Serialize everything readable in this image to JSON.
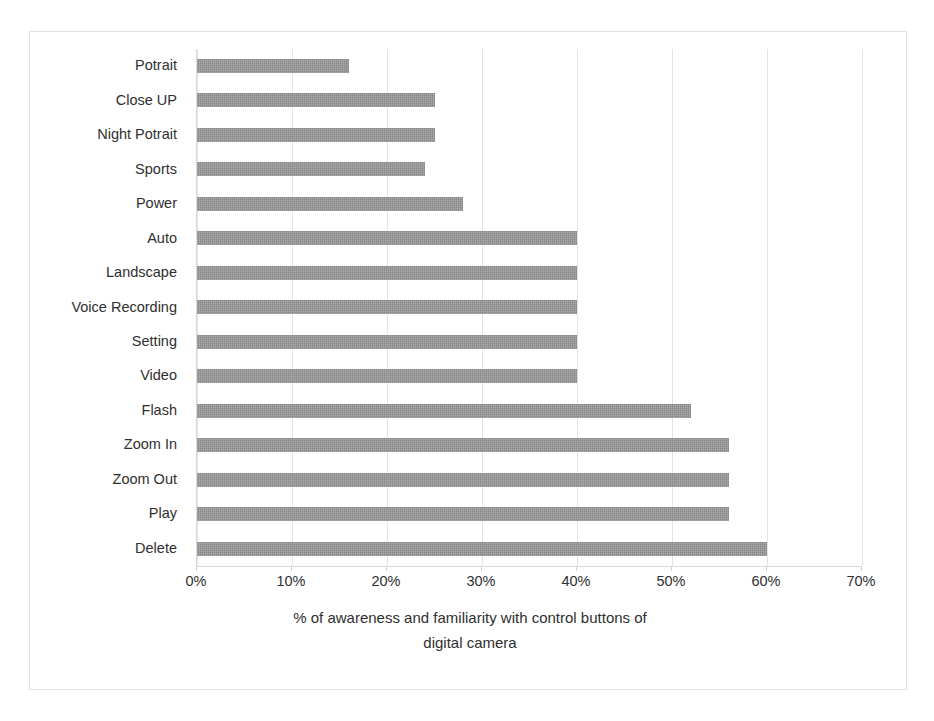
{
  "chart_data": {
    "type": "bar",
    "orientation": "horizontal",
    "title": "",
    "xlabel": "% of awareness and familiarity with control buttons of digital camera",
    "ylabel": "",
    "xlim": [
      0,
      70
    ],
    "xtick_labels": [
      "0%",
      "10%",
      "20%",
      "30%",
      "40%",
      "50%",
      "60%",
      "70%"
    ],
    "xticks": [
      0,
      10,
      20,
      30,
      40,
      50,
      60,
      70
    ],
    "grid": true,
    "legend": false,
    "bar_color": "#969696",
    "categories": [
      "Potrait",
      "Close UP",
      "Night Potrait",
      "Sports",
      "Power",
      "Auto",
      "Landscape",
      "Voice Recording",
      "Setting",
      "Video",
      "Flash",
      "Zoom In",
      "Zoom Out",
      "Play",
      "Delete"
    ],
    "values": [
      16,
      25,
      25,
      24,
      28,
      40,
      40,
      40,
      40,
      40,
      52,
      56,
      56,
      56,
      60
    ]
  },
  "axis_title_lines": [
    "% of awareness and familiarity with control buttons of",
    "digital camera"
  ]
}
